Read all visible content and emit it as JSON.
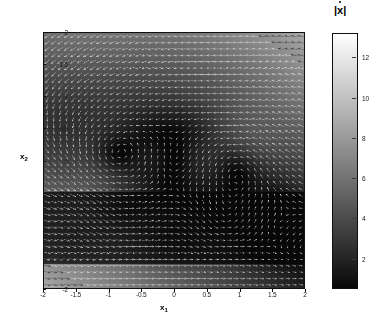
{
  "figure": {
    "kind": "quiver-phase-portrait",
    "background": "#ffffff"
  },
  "axes": {
    "xlabel": "x",
    "xlabel_sub": "1",
    "ylabel": "x",
    "ylabel_sub": "2",
    "xticks": [
      "-2",
      "-1.5",
      "-1",
      "-0.5",
      "0",
      "0.5",
      "1",
      "1.5",
      "2"
    ],
    "yticks": [
      "2",
      "1.5",
      "1",
      "0.5",
      "0",
      "-0.5",
      "-1",
      "-1.5",
      "-2"
    ]
  },
  "colorbar": {
    "title_bar_left": "|",
    "title_symbol": "x",
    "title_bar_right": "|",
    "ticks": [
      "2",
      "4",
      "6",
      "8",
      "10",
      "12"
    ]
  },
  "chart_data": {
    "type": "heatmap",
    "title": "",
    "xlabel": "x_1",
    "ylabel": "x_2",
    "xlim": [
      -2,
      2
    ],
    "ylim": [
      -2,
      2
    ],
    "grid": false,
    "legend_position": "right-colorbar",
    "colormap": "gray",
    "colorbar_label": "|xdot|",
    "colorbar_ticks": [
      2,
      4,
      6,
      8,
      10,
      12
    ],
    "clim": [
      0.5,
      13.2
    ],
    "overlay": "quiver arrows (white/gray) on grayscale magnitude field",
    "quiver_grid_nx": 40,
    "quiver_grid_ny": 40,
    "xticks": [
      -2,
      -1.5,
      -1,
      -0.5,
      0,
      0.5,
      1,
      1.5,
      2
    ],
    "yticks": [
      -2,
      -1.5,
      -1,
      -0.5,
      0,
      0.5,
      1,
      1.5,
      2
    ],
    "features": {
      "bright_corners": [
        "top-left",
        "bottom-right"
      ],
      "dark_band_y_range": [
        -1.62,
        -0.5
      ],
      "vortex_centers_upper_row": [
        {
          "x": -1.0,
          "y": 0.02
        },
        {
          "x": 0.05,
          "y": 0.0
        },
        {
          "x": 1.02,
          "y": 0.02
        }
      ],
      "vortex_centers_lower_band": [
        {
          "x": -1.62,
          "y": -1.0
        },
        {
          "x": -0.82,
          "y": -1.0
        },
        {
          "x": -0.02,
          "y": -1.0
        },
        {
          "x": 0.78,
          "y": -1.0
        },
        {
          "x": 1.58,
          "y": -1.0
        }
      ]
    },
    "magnitude_samples": [
      {
        "x": -2.0,
        "y": 2.0,
        "value": 13.0
      },
      {
        "x": -2.0,
        "y": 0.0,
        "value": 11.5
      },
      {
        "x": -2.0,
        "y": -2.0,
        "value": 5.0
      },
      {
        "x": 0.0,
        "y": 2.0,
        "value": 4.5
      },
      {
        "x": 0.0,
        "y": 0.0,
        "value": 1.2
      },
      {
        "x": 0.0,
        "y": -1.0,
        "value": 0.9
      },
      {
        "x": 0.0,
        "y": -2.0,
        "value": 4.0
      },
      {
        "x": 2.0,
        "y": 2.0,
        "value": 6.5
      },
      {
        "x": 2.0,
        "y": 0.0,
        "value": 7.5
      },
      {
        "x": 2.0,
        "y": -2.0,
        "value": 12.8
      },
      {
        "x": -1.0,
        "y": 0.0,
        "value": 0.8
      },
      {
        "x": 1.0,
        "y": 0.0,
        "value": 0.8
      }
    ]
  }
}
